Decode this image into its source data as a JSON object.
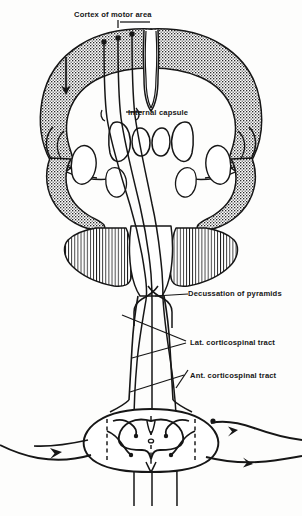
{
  "figure": {
    "type": "anatomical-line-diagram",
    "background_color": "#fdfdfc",
    "ink_color": "#161616"
  },
  "labels": {
    "cortex": "Cortex of motor area",
    "internal_capsule": "Internal capsule",
    "decussation": "Decussation of pyramids",
    "lateral_tract": "Lat. corticospinal tract",
    "anterior_tract": "Ant. corticospinal tract"
  },
  "structures": {
    "cerebrum": "cerebral-hemispheres-coronal-section",
    "cortical_ribbon": "stippled-gray-matter-cortex",
    "thalamic_nuclei": "paired-teardrop-nuclei",
    "basal_ganglia": "lentiform-and-caudate-outlines",
    "brainstem": "vertically-hatched-pons-and-medulla",
    "spinal_cord": "butterfly-gray-matter-cross-section",
    "central_canal": "central-canal",
    "peripheral_nerves": "spinal-nerve-roots-with-arrows",
    "descending_fibers": "three-corticospinal-fiber-lines",
    "direction_arrow": "downward-flow-arrow"
  },
  "markers": {
    "cortical_origins": 3,
    "descending_fiber_count": 3,
    "synaptic_terminals": 4,
    "nerve_arrows": 4,
    "dashed_guides": 6
  }
}
